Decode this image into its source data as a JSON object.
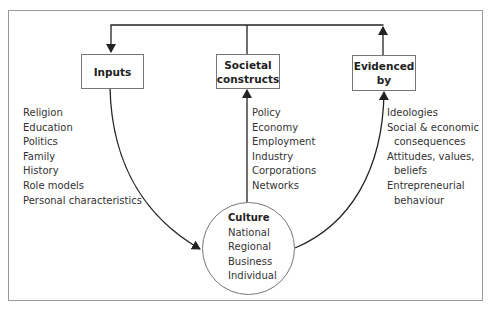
{
  "diagram": {
    "boxes": {
      "inputs": {
        "lines": [
          "Inputs"
        ]
      },
      "societal_constructs": {
        "lines": [
          "Societal",
          "constructs"
        ]
      },
      "evidenced_by": {
        "lines": [
          "Evidenced",
          "by"
        ]
      }
    },
    "inputs_list": [
      "Religion",
      "Education",
      "Politics",
      "Family",
      "History",
      "Role models",
      "Personal characteristics"
    ],
    "societal_constructs_list": [
      "Policy",
      "Economy",
      "Employment",
      "Industry",
      "Corporations",
      "Networks"
    ],
    "evidenced_by_list": {
      "l0": "Ideologies",
      "l1": "Social & economic",
      "l2": "consequences",
      "l3": "Attitudes, values,",
      "l4": "beliefs",
      "l5": "Entrepreneurial",
      "l6": "behaviour"
    },
    "culture": {
      "title": "Culture",
      "items": [
        "National",
        "Regional",
        "Business",
        "Individual"
      ]
    },
    "connections": [
      {
        "from": "evidenced_by",
        "to": "inputs",
        "via": "top-loop"
      },
      {
        "from": "societal_constructs",
        "to": "top-loop",
        "via": "line"
      },
      {
        "from": "inputs",
        "to": "culture",
        "via": "curved-arrow"
      },
      {
        "from": "culture",
        "to": "societal_constructs",
        "via": "arrow"
      },
      {
        "from": "culture",
        "to": "evidenced_by",
        "via": "curved-arrow"
      }
    ],
    "colors": {
      "line": "#2a2a2a",
      "border": "#777777",
      "frame": "#9a9a9a",
      "text": "#333333"
    }
  }
}
